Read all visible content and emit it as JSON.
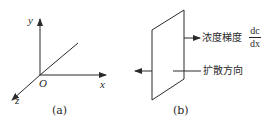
{
  "panel_a": {
    "caption": "(a)",
    "axes": {
      "x": "x",
      "y": "y",
      "z": "z",
      "origin": "O"
    }
  },
  "panel_b": {
    "caption": "(b)",
    "gradient_label": "浓度梯度",
    "gradient_fraction": {
      "numerator": "dc",
      "denominator": "dx"
    },
    "diffusion_label": "扩散方向"
  },
  "colors": {
    "line": "#2a2a2a",
    "background": "#ffffff"
  }
}
